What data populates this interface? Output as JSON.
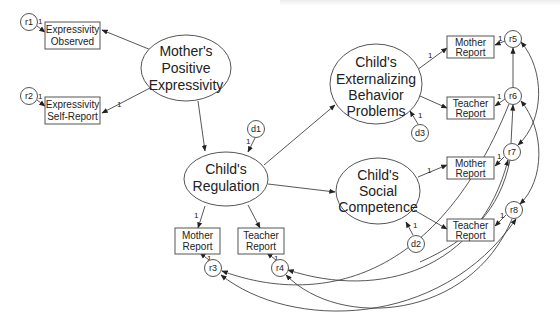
{
  "diagram": {
    "type": "structural-equation-model",
    "latent_variables": [
      {
        "id": "mpe",
        "lines": [
          "Mother's",
          "Positive",
          "Expressivity"
        ]
      },
      {
        "id": "reg",
        "lines": [
          "Child's",
          "Regulation"
        ]
      },
      {
        "id": "ext",
        "lines": [
          "Child's",
          "Externalizing",
          "Behavior",
          "Problems"
        ]
      },
      {
        "id": "soc",
        "lines": [
          "Child's",
          "Social",
          "Competence"
        ]
      }
    ],
    "observed_variables": [
      {
        "id": "exp_obs",
        "lines": [
          "Expressivity",
          "Observed"
        ],
        "latent": "mpe",
        "error": "r1"
      },
      {
        "id": "exp_self",
        "lines": [
          "Expressivity",
          "Self-Report"
        ],
        "latent": "mpe",
        "error": "r2"
      },
      {
        "id": "reg_mother",
        "lines": [
          "Mother",
          "Report"
        ],
        "latent": "reg",
        "error": "r3"
      },
      {
        "id": "reg_teacher",
        "lines": [
          "Teacher",
          "Report"
        ],
        "latent": "reg",
        "error": "r4"
      },
      {
        "id": "ext_mother",
        "lines": [
          "Mother",
          "Report"
        ],
        "latent": "ext",
        "error": "r5"
      },
      {
        "id": "ext_teacher",
        "lines": [
          "Teacher",
          "Report"
        ],
        "latent": "ext",
        "error": "r6"
      },
      {
        "id": "soc_mother",
        "lines": [
          "Mother",
          "Report"
        ],
        "latent": "soc",
        "error": "r7"
      },
      {
        "id": "soc_teacher",
        "lines": [
          "Teacher",
          "Report"
        ],
        "latent": "soc",
        "error": "r8"
      }
    ],
    "errors": [
      "r1",
      "r2",
      "r3",
      "r4",
      "r5",
      "r6",
      "r7",
      "r8"
    ],
    "disturbances": [
      "d1",
      "d2",
      "d3"
    ],
    "fixed_loading_label": "1",
    "structural_paths": [
      {
        "from": "mpe",
        "to": "reg"
      },
      {
        "from": "reg",
        "to": "ext"
      },
      {
        "from": "reg",
        "to": "soc"
      }
    ],
    "covariances": [
      [
        "r5",
        "r6"
      ],
      [
        "r5",
        "r7"
      ],
      [
        "r6",
        "r8"
      ],
      [
        "r6",
        "r7"
      ],
      [
        "r3",
        "r7"
      ],
      [
        "r3",
        "r8"
      ],
      [
        "r4",
        "r7"
      ],
      [
        "r4",
        "r8"
      ]
    ]
  },
  "labels": {
    "mpe": [
      "Mother's",
      "Positive",
      "Expressivity"
    ],
    "reg": [
      "Child's",
      "Regulation"
    ],
    "ext": [
      "Child's",
      "Externalizing",
      "Behavior",
      "Problems"
    ],
    "soc": [
      "Child's",
      "Social",
      "Competence"
    ],
    "exp_obs": [
      "Expressivity",
      "Observed"
    ],
    "exp_self": [
      "Expressivity",
      "Self-Report"
    ],
    "reg_mother": [
      "Mother",
      "Report"
    ],
    "reg_teacher": [
      "Teacher",
      "Report"
    ],
    "ext_mother": [
      "Mother",
      "Report"
    ],
    "ext_teacher": [
      "Teacher",
      "Report"
    ],
    "soc_mother": [
      "Mother",
      "Report"
    ],
    "soc_teacher": [
      "Teacher",
      "Report"
    ],
    "r1": "r1",
    "r2": "r2",
    "r3": "r3",
    "r4": "r4",
    "r5": "r5",
    "r6": "r6",
    "r7": "r7",
    "r8": "r8",
    "d1": "d1",
    "d2": "d2",
    "d3": "d3",
    "one": "1"
  }
}
